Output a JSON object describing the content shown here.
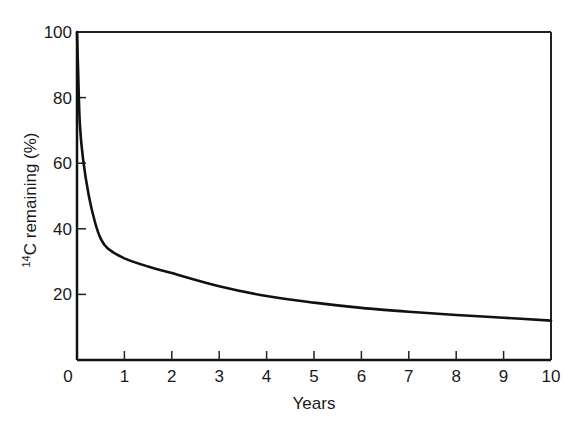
{
  "chart_data": {
    "type": "line",
    "title": "",
    "xlabel": "Years",
    "ylabel": "14C remaining (%)",
    "ylabel_parts": {
      "superscript": "14",
      "main": "C remaining (%)"
    },
    "xlim": [
      0,
      10
    ],
    "ylim": [
      0,
      100
    ],
    "x_ticks": [
      0,
      1,
      2,
      3,
      4,
      5,
      6,
      7,
      8,
      9,
      10
    ],
    "y_ticks": [
      20,
      40,
      60,
      80,
      100
    ],
    "y_tick_labels": [
      "20",
      "40",
      "60",
      "80",
      "100"
    ],
    "grid": false,
    "legend": null,
    "series": [
      {
        "name": "14C remaining",
        "color": "#111111",
        "x": [
          0,
          0.02,
          0.06,
          0.13,
          0.25,
          0.38,
          0.5,
          0.65,
          1,
          1.5,
          2,
          3,
          4,
          5,
          6,
          7,
          8,
          9,
          10
        ],
        "y": [
          100,
          90,
          72,
          61,
          50,
          42,
          37,
          34,
          31,
          28.5,
          26.5,
          22.5,
          19.5,
          17.5,
          15.9,
          14.7,
          13.7,
          12.9,
          12
        ]
      }
    ]
  }
}
